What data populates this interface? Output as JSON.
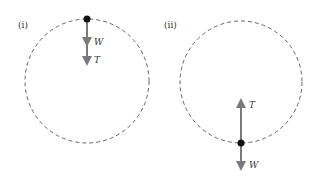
{
  "diagrams": [
    {
      "label": "(i)",
      "position": "top",
      "forces": [
        {
          "name": "W",
          "direction": "down"
        },
        {
          "name": "T",
          "direction": "down"
        }
      ]
    },
    {
      "label": "(ii)",
      "position": "bottom",
      "forces": [
        {
          "name": "T",
          "direction": "up"
        },
        {
          "name": "W",
          "direction": "down"
        }
      ]
    }
  ],
  "colors": {
    "circle": "#555555",
    "arrow": "#7a7a7a",
    "point": "#111111",
    "text": "#333333"
  }
}
